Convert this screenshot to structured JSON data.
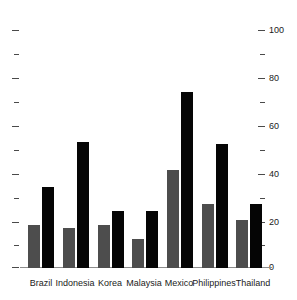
{
  "chart_data": {
    "type": "bar",
    "title": "",
    "subtitle": "",
    "xlabel": "",
    "ylabel": "",
    "ylim": [
      0,
      100
    ],
    "grid": false,
    "legend": "none",
    "axis_labels_side": "right",
    "categories": [
      "Brazil",
      "Indonesia",
      "Korea",
      "Malaysia",
      "Mexico",
      "Philippines",
      "Thailand"
    ],
    "y_major_ticks": [
      0,
      20,
      40,
      60,
      80,
      100
    ],
    "y_minor_ticks": [
      10,
      30,
      50,
      70,
      90
    ],
    "y_tick_labels": [
      "0",
      "20",
      "40",
      "60",
      "80",
      "100"
    ],
    "series": [
      {
        "name": "series-1",
        "color": "#4d4d4d",
        "values": [
          18,
          17,
          18,
          12,
          41,
          27,
          20
        ]
      },
      {
        "name": "series-2",
        "color": "#050505",
        "values": [
          34,
          53,
          24,
          24,
          74,
          52,
          27
        ]
      }
    ]
  },
  "axis": {
    "tick_label_0": "0",
    "tick_label_20": "20",
    "tick_label_40": "40",
    "tick_label_60": "60",
    "tick_label_80": "80",
    "tick_label_100": "100"
  },
  "categories": {
    "c0": "Brazil",
    "c1": "Indonesia",
    "c2": "Korea",
    "c3": "Malaysia",
    "c4": "Mexico",
    "c5": "Philippines",
    "c6": "Thailand"
  },
  "colors": {
    "series_1": "#4d4d4d",
    "series_2": "#050505",
    "axis": "#8c8c8c",
    "text": "#1a1a1a",
    "background": "#ffffff"
  }
}
